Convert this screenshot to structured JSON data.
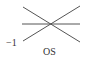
{
  "diagram": {
    "labels": {
      "left_value": "−1",
      "bottom_label": "OS"
    },
    "lines": [
      {
        "name": "horizontal-line",
        "description": "horizontal line through crossing point"
      },
      {
        "name": "descending-diagonal",
        "description": "diagonal from upper-left to lower-right"
      },
      {
        "name": "ascending-diagonal",
        "description": "diagonal from lower-left to upper-right"
      }
    ],
    "colors": {
      "line": "#555555",
      "text": "#333333",
      "background": "#ffffff"
    }
  }
}
